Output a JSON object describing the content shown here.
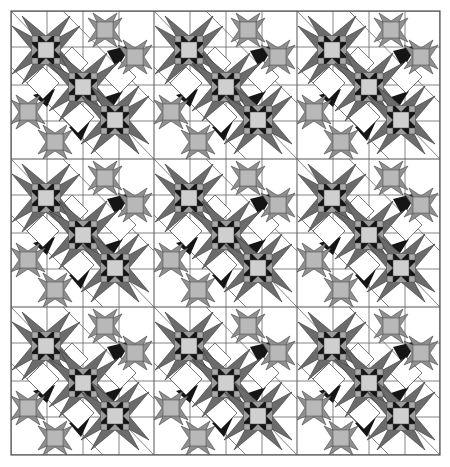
{
  "figure": {
    "type": "quilt-pattern-diagram",
    "repeat": {
      "columns": 3,
      "rows": 3
    },
    "bounds": {
      "x": 11,
      "y": 11,
      "width": 429,
      "height": 444
    },
    "tile": {
      "width": 143,
      "height": 148
    }
  },
  "palette": {
    "background": "#ffffff",
    "outline": "#555555",
    "dark_gray": "#6b6b6b",
    "black": "#151515",
    "mid_gray": "#8f8f8f",
    "light_gray": "#bdbdbd",
    "pale_gray": "#cfcfcf",
    "white": "#ffffff"
  },
  "elements": {
    "large_stars": [
      {
        "cx": 35,
        "cy": 39,
        "r": 35
      },
      {
        "cx": 72,
        "cy": 76,
        "r": 33
      },
      {
        "cx": 104,
        "cy": 109,
        "r": 35
      }
    ],
    "small_stars": [
      {
        "cx": 94,
        "cy": 19,
        "r": 17
      },
      {
        "cx": 124,
        "cy": 46,
        "r": 17
      },
      {
        "cx": 17,
        "cy": 101,
        "r": 16
      },
      {
        "cx": 44,
        "cy": 131,
        "r": 17
      }
    ],
    "diamonds": [
      {
        "cx": 61,
        "cy": 52,
        "r": 16
      },
      {
        "cx": 32,
        "cy": 72,
        "r": 16
      },
      {
        "cx": 109,
        "cy": 66,
        "r": 16
      },
      {
        "cx": 67,
        "cy": 106,
        "r": 16
      }
    ]
  }
}
